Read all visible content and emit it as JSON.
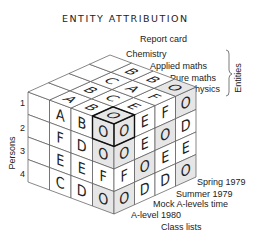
{
  "title": "ENTITY ATTRIBUTION",
  "labels": {
    "report_card": "Report card",
    "entities": [
      "Chemistry",
      "Applied maths",
      "Pure maths",
      "Physics"
    ],
    "entities_axis": "Entities",
    "persons_axis": "Persons",
    "persons": [
      "1",
      "2",
      "3",
      "4"
    ],
    "times": [
      "Spring 1979",
      "Summer 1979",
      "Mock A-levels time",
      "A-level 1980"
    ],
    "class_lists": "Class lists"
  },
  "cube": {
    "shade_letter": "O",
    "highlight": "front-top-corner",
    "left_face_rows": [
      [
        "",
        "A",
        "B",
        "O"
      ],
      [
        "",
        "F",
        "D",
        "O"
      ],
      [
        "",
        "E",
        "E",
        "F"
      ],
      [
        "",
        "C",
        "D",
        "O"
      ]
    ],
    "right_face_rows": [
      [
        "O",
        "E",
        "F",
        "O"
      ],
      [
        "O",
        "E",
        "O",
        "D"
      ],
      [
        "F",
        "O",
        "E",
        "E"
      ],
      [
        "O",
        "D",
        "D",
        "O"
      ]
    ],
    "top_face_rows": [
      [
        "O",
        "B",
        "A",
        ""
      ],
      [
        "E",
        "C",
        "B",
        ""
      ],
      [
        "F",
        "A",
        "C",
        ""
      ],
      [
        "O",
        "B",
        "B",
        ""
      ]
    ]
  }
}
